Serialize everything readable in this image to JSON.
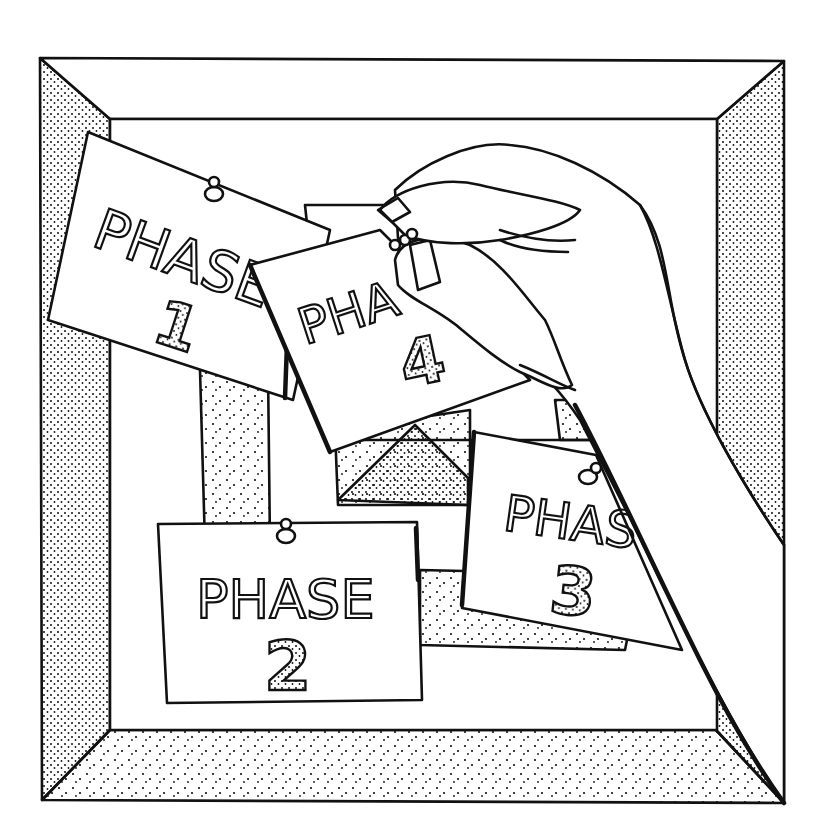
{
  "illustration": {
    "subject": "Hand pinning phase cards to a bulletin board",
    "ink_color": "#111111",
    "paper_color": "#ffffff",
    "cards": [
      {
        "id": "phase-1",
        "word": "PHASE",
        "number": "1"
      },
      {
        "id": "phase-2",
        "word": "PHASE",
        "number": "2"
      },
      {
        "id": "phase-3",
        "word": "PHAS",
        "number": "3"
      },
      {
        "id": "phase-4",
        "word": "PHA",
        "number": "4"
      }
    ]
  }
}
